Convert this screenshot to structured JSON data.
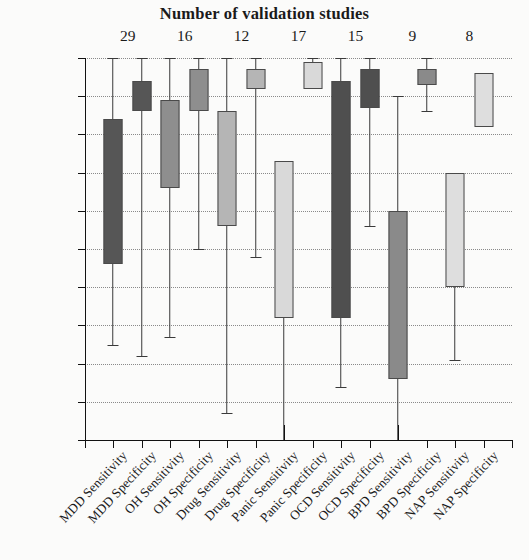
{
  "chart_data": {
    "type": "box",
    "title": "Number of validation studies",
    "xlabel": "",
    "ylabel": "",
    "ylim": [
      0,
      100
    ],
    "yticks": [
      0,
      10,
      20,
      30,
      40,
      50,
      60,
      70,
      80,
      90,
      100
    ],
    "grid": true,
    "legend": "none",
    "group_counts": [
      {
        "group": "MDD",
        "count": "29"
      },
      {
        "group": "OH",
        "count": "16"
      },
      {
        "group": "Drug",
        "count": "12"
      },
      {
        "group": "Panic",
        "count": "17"
      },
      {
        "group": "OCD",
        "count": "15"
      },
      {
        "group": "BPD",
        "count": "9"
      },
      {
        "group": "NAP",
        "count": "8"
      }
    ],
    "categories": [
      "MDD Sensitivity",
      "MDD Specificity",
      "OH Sensitivity",
      "OH Specificity",
      "Drug Sensitivity",
      "Drug Specificity",
      "Panic Sensitivity",
      "Panic Specificity",
      "OCD Sensitivity",
      "OCD Specificity",
      "BPD Sensitivity",
      "BPD Specificity",
      "NAP Sensitivity",
      "NAP Specificity"
    ],
    "boxes": [
      {
        "label": "MDD Sensitivity",
        "whisker_low": 25,
        "q1": 46,
        "q3": 84,
        "whisker_high": 100,
        "fill": "#565656"
      },
      {
        "label": "MDD Specificity",
        "whisker_low": 22,
        "q1": 86,
        "q3": 94,
        "whisker_high": 100,
        "fill": "#565656"
      },
      {
        "label": "OH Sensitivity",
        "whisker_low": 27,
        "q1": 66,
        "q3": 89,
        "whisker_high": 100,
        "fill": "#8e8e8e"
      },
      {
        "label": "OH Specificity",
        "whisker_low": 50,
        "q1": 86,
        "q3": 97,
        "whisker_high": 100,
        "fill": "#8e8e8e"
      },
      {
        "label": "Drug Sensitivity",
        "whisker_low": 7,
        "q1": 56,
        "q3": 86,
        "whisker_high": 100,
        "fill": "#b5b5b5"
      },
      {
        "label": "Drug Specificity",
        "whisker_low": 48,
        "q1": 92,
        "q3": 97,
        "whisker_high": 100,
        "fill": "#b5b5b5"
      },
      {
        "label": "Panic Sensitivity",
        "whisker_low": 0,
        "q1": 32,
        "q3": 73,
        "whisker_high": 73,
        "fill": "#d9d9d9"
      },
      {
        "label": "Panic Specificity",
        "whisker_low": 92,
        "q1": 92,
        "q3": 99,
        "whisker_high": 100,
        "fill": "#d9d9d9"
      },
      {
        "label": "OCD Sensitivity",
        "whisker_low": 14,
        "q1": 32,
        "q3": 94,
        "whisker_high": 100,
        "fill": "#4f4f4f"
      },
      {
        "label": "OCD Specificity",
        "whisker_low": 56,
        "q1": 87,
        "q3": 97,
        "whisker_high": 100,
        "fill": "#4f4f4f"
      },
      {
        "label": "BPD Sensitivity",
        "whisker_low": 0,
        "q1": 16,
        "q3": 60,
        "whisker_high": 90,
        "fill": "#8a8a8a"
      },
      {
        "label": "BPD Specificity",
        "whisker_low": 86,
        "q1": 93,
        "q3": 97,
        "whisker_high": 100,
        "fill": "#8a8a8a"
      },
      {
        "label": "NAP Sensitivity",
        "whisker_low": 21,
        "q1": 40,
        "q3": 70,
        "whisker_high": 70,
        "fill": "#dedede"
      },
      {
        "label": "NAP Specificity",
        "whisker_low": 82,
        "q1": 82,
        "q3": 96,
        "whisker_high": 96,
        "fill": "#dedede"
      }
    ]
  },
  "colors": {
    "axis": "#111111",
    "grid": "#8a8a8a",
    "background": "#fbfbfa",
    "dark_box": "#565656",
    "mid_box": "#8e8e8e",
    "light_box": "#d9d9d9"
  }
}
